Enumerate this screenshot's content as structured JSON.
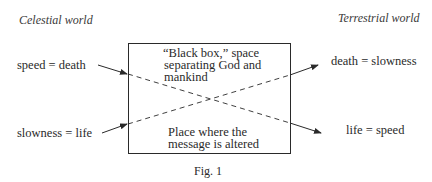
{
  "diagram": {
    "left_heading": "Celestial world",
    "right_heading": "Terrestrial world",
    "left_labels": {
      "top": "speed = death",
      "bottom": "slowness = life"
    },
    "right_labels": {
      "top": "death = slowness",
      "bottom": "life = speed"
    },
    "box": {
      "top_text_line1": "“Black box,” space",
      "top_text_line2": "separating God and",
      "top_text_line3": "mankind",
      "bottom_text_line1": "Place where the",
      "bottom_text_line2": "message is altered"
    },
    "caption": "Fig. 1",
    "connections": [
      {
        "from": "speed = death",
        "to": "life = speed",
        "style": "solid-dashed-solid arrow"
      },
      {
        "from": "slowness = life",
        "to": "death = slowness",
        "style": "solid-dashed-solid arrow"
      }
    ]
  }
}
